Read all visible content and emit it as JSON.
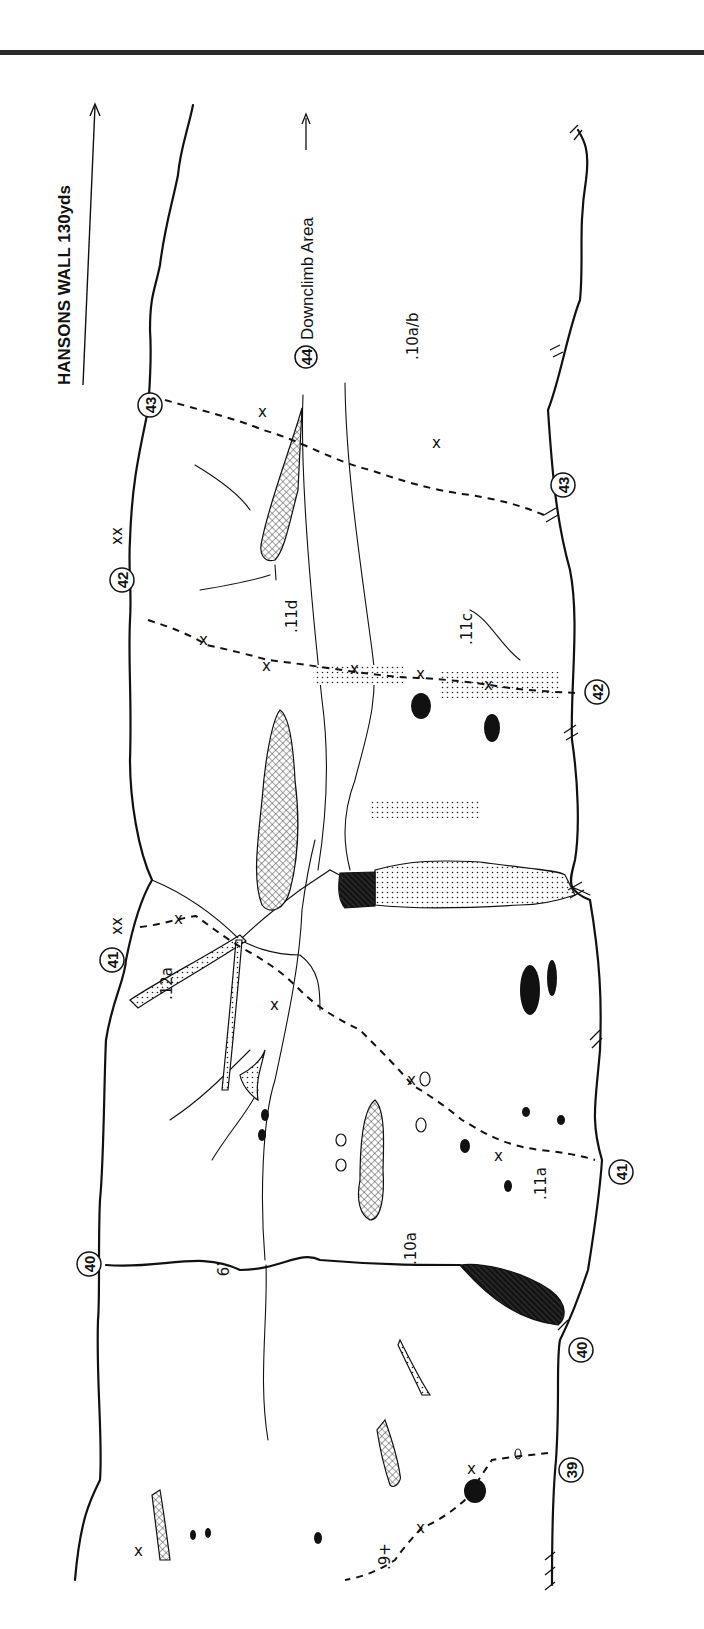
{
  "header": {
    "title": "HANSONS WALL 130yds",
    "downclimb_marker": "44",
    "downclimb_label": "Downclimb Area"
  },
  "routes": [
    {
      "number": "39",
      "grade": ".9+"
    },
    {
      "number": "40",
      "grade": ".10a",
      "left_grade": ".9"
    },
    {
      "number": "41",
      "grade": ".11a",
      "upper_grade": ".12a"
    },
    {
      "number": "42",
      "grade": ".11c",
      "upper_grade": ".11d"
    },
    {
      "number": "43",
      "grade": ".10a/b"
    }
  ],
  "markers": {
    "m39": "39",
    "m40_top": "40",
    "m40_bottom": "40",
    "m41_top": "41",
    "m41_bottom": "41",
    "m42_top": "42",
    "m42_bottom": "42",
    "m43_top": "43",
    "m43_bottom": "43",
    "m44": "44"
  },
  "grades": {
    "g39": ".9+",
    "g40_left": ".9",
    "g40": ".10a",
    "g41": ".11a",
    "g41_upper": ".12a",
    "g42": ".11c",
    "g42_upper": ".11d",
    "g43": ".10a/b"
  },
  "bolt_symbol": "x",
  "anchor_symbol": "xx",
  "legend_patterns": [
    "crosshatch",
    "dots",
    "solid-black",
    "dark-crosshatch"
  ]
}
